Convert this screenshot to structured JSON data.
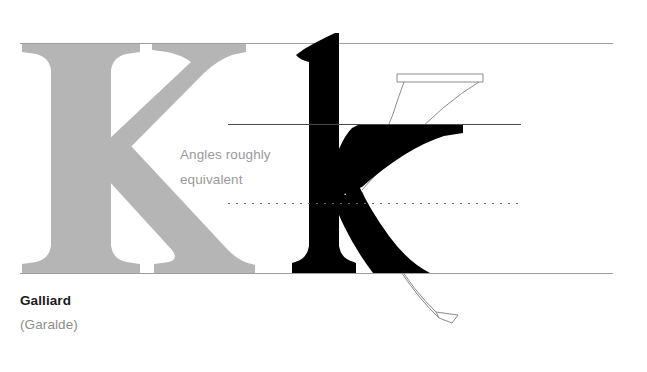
{
  "specimen": {
    "typeface_label": "Galliard",
    "classification_label": "(Garalde)",
    "annotation_text": "Angles roughly\nequivalent",
    "colors": {
      "background": "#ffffff",
      "reference_glyph_gray": "#b5b5b5",
      "subject_glyph_black": "#000000",
      "guide_line_gray": "#9a9a9a",
      "xheight_line_gray": "#555555",
      "outline_stroke_gray": "#8c8c8c",
      "caption_black": "#1a1a1a",
      "caption_gray": "#8d8d8d",
      "annotation_gray": "#9a9a9a"
    },
    "glyphs": [
      {
        "name": "reference-capital-k",
        "character": "K",
        "style": "filled-gray"
      },
      {
        "name": "subject-lowercase-k",
        "character": "k",
        "style": "filled-black"
      },
      {
        "name": "overlay-capital-k-outline",
        "character": "K",
        "style": "outline-only"
      }
    ],
    "guides": [
      {
        "name": "cap-height-line",
        "style": "solid",
        "y": 43,
        "x1": 20,
        "x2": 613
      },
      {
        "name": "x-height-line",
        "style": "solid",
        "y": 124,
        "x1": 228,
        "x2": 521
      },
      {
        "name": "angle-vertex-line",
        "style": "dotted",
        "y": 203,
        "x1": 228,
        "x2": 519
      },
      {
        "name": "baseline",
        "style": "solid",
        "y": 273,
        "x1": 20,
        "x2": 613
      }
    ]
  }
}
